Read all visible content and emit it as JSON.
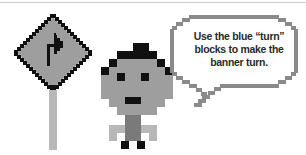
{
  "scene": {
    "description": "Pixel-art instruction illustration",
    "colors": {
      "outline": "#111111",
      "sign_fill": "#9e9e9e",
      "pole": "#b8b8b8",
      "face": "#9e9e9e",
      "body": "#7a7a7a",
      "bubble_border": "#8a8a8a",
      "background": "#ffffff"
    }
  },
  "sign": {
    "icon": "turn-right-arrow-icon"
  },
  "speech_bubble": {
    "line1": "Use the blue “turn”",
    "line2": "blocks to make the",
    "line3": "banner turn."
  }
}
